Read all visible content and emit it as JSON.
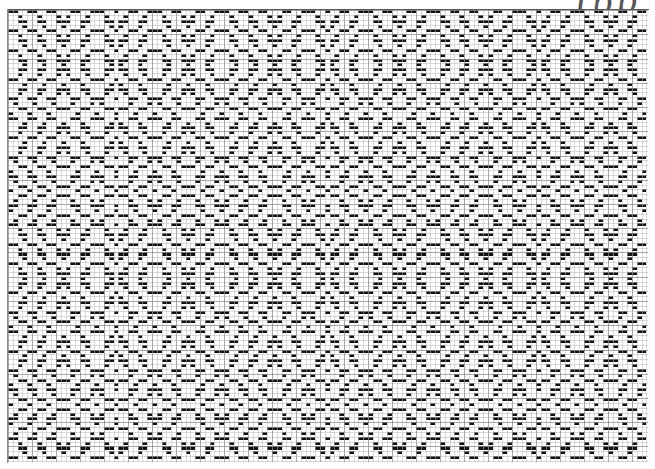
{
  "document": {
    "kind": "weaving-draft",
    "title": "Overshot Weaving Draft",
    "annotation_text": "Ipp",
    "ink_color": "#111111",
    "paper_color": "#ffffff",
    "grid_line_color": "#b9b9b9",
    "grid_major_color": "#777777",
    "rule_color": "#5a5a5a"
  },
  "grid": {
    "cell_width": 4.8,
    "cell_height": 4.85,
    "columns": 133,
    "rows": 93,
    "major_every_x": 5,
    "major_every_y": 5,
    "origin_x": 8,
    "origin_y": 10,
    "width": 640,
    "height": 452
  },
  "draft": {
    "shafts": 4,
    "weave_structure": "overshot",
    "threading_label": "threading",
    "treadling_label": "treadling",
    "tie_up_label": "tie-up",
    "threading_repeat_length": 44,
    "treadling_repeat_length": 44,
    "threading": [
      0,
      1,
      2,
      3,
      0,
      1,
      2,
      3,
      0,
      1,
      2,
      3,
      2,
      1,
      0,
      3,
      2,
      1,
      0,
      1,
      2,
      3,
      0,
      3,
      2,
      1,
      0,
      3,
      2,
      1,
      0,
      1,
      2,
      3,
      0,
      1,
      2,
      3,
      2,
      1,
      0,
      3,
      2,
      1
    ],
    "treadling": [
      0,
      1,
      2,
      3,
      0,
      1,
      2,
      3,
      0,
      1,
      2,
      3,
      2,
      1,
      0,
      3,
      2,
      1,
      0,
      1,
      2,
      3,
      0,
      3,
      2,
      1,
      0,
      3,
      2,
      1,
      0,
      1,
      2,
      3,
      0,
      1,
      2,
      3,
      2,
      1,
      0,
      3,
      2,
      1
    ],
    "tie_up": [
      [
        1,
        1,
        0,
        0
      ],
      [
        0,
        1,
        1,
        0
      ],
      [
        0,
        0,
        1,
        1
      ],
      [
        1,
        0,
        0,
        1
      ]
    ],
    "ground_offsets": [
      0,
      2
    ]
  },
  "chart_data": {
    "type": "heatmap",
    "xlabel": "warp ends",
    "ylabel": "weft picks",
    "colormap": [
      "#ffffff",
      "#111111"
    ],
    "xlim": [
      0,
      133
    ],
    "ylim": [
      0,
      93
    ],
    "grid": true,
    "legend": "none"
  }
}
